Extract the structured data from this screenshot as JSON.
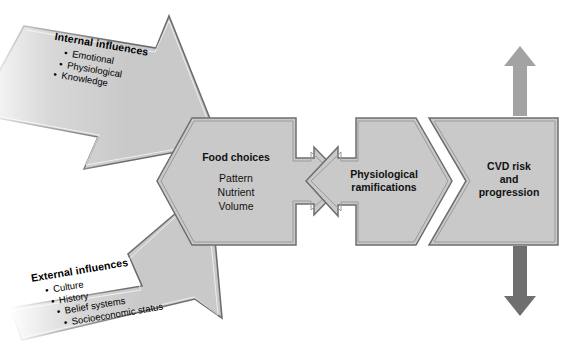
{
  "diagram": {
    "colors": {
      "shape_fill": "#c9c9c9",
      "shape_stroke": "#6e6e6e",
      "shape_inner_stroke": "#8e8e8e",
      "text": "#141414",
      "up_arrow": "#a3a3a3",
      "down_arrow": "#6f6f6f",
      "background": "#ffffff"
    },
    "inputs": [
      {
        "id": "internal",
        "heading": "Internal influences",
        "bullets": [
          "Emotional",
          "Physiological",
          "Knowledge"
        ],
        "direction": "down-right"
      },
      {
        "id": "external",
        "heading": "External influences",
        "bullets": [
          "Culture",
          "History",
          "Belief systems",
          "Socioeconomic status"
        ],
        "direction": "up-right"
      }
    ],
    "stages": [
      {
        "id": "food-choices",
        "title": "Food choices",
        "lines": [
          "Pattern",
          "Nutrient",
          "Volume"
        ]
      },
      {
        "id": "physiological-ramifications",
        "title": "Physiological\nramifications",
        "title_line1": "Physiological",
        "title_line2": "ramifications",
        "lines": []
      },
      {
        "id": "cvd-risk",
        "title_line1": "CVD risk",
        "title_line2": "and",
        "title_line3": "progression",
        "lines": []
      }
    ],
    "outcome_arrows": [
      {
        "id": "increase-arrow",
        "direction": "up"
      },
      {
        "id": "decrease-arrow",
        "direction": "down"
      }
    ]
  }
}
